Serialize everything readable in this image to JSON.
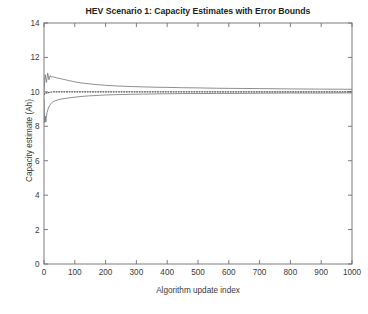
{
  "figure": {
    "title": "HEV Scenario 1: Capacity Estimates with Error Bounds",
    "x_axis_label": "Algorithm update index",
    "y_axis_label": "Capacity estimate (Ah)",
    "bottom_caption": "",
    "background_color": "#ffffff",
    "axis_color": "#6d6e71",
    "text_color": "#231f20"
  },
  "chart_data": {
    "type": "line",
    "title": "HEV Scenario 1: Capacity Estimates with Error Bounds",
    "xlabel": "Algorithm update index",
    "ylabel": "Capacity estimate (Ah)",
    "xlim": [
      0,
      1000
    ],
    "ylim": [
      0,
      14
    ],
    "xticks": [
      0,
      100,
      200,
      300,
      400,
      500,
      600,
      700,
      800,
      900,
      1000
    ],
    "yticks": [
      0,
      2,
      4,
      6,
      8,
      10,
      12,
      14
    ],
    "xtick_labels": [
      "0",
      "100",
      "200",
      "300",
      "400",
      "500",
      "600",
      "700",
      "800",
      "900",
      "1000"
    ],
    "ytick_labels": [
      "0",
      "2",
      "4",
      "6",
      "8",
      "10",
      "12",
      "14"
    ],
    "grid": false,
    "legend": null,
    "tick_direction": "in",
    "series": [
      {
        "name": "Upper error bound",
        "style": "solid",
        "color": "#7a7a7d",
        "x": [
          0,
          4,
          8,
          12,
          16,
          20,
          24,
          28,
          32,
          36,
          40,
          50,
          60,
          70,
          80,
          90,
          100,
          120,
          140,
          160,
          180,
          200,
          240,
          280,
          320,
          360,
          400,
          450,
          500,
          560,
          620,
          700,
          800,
          900,
          1000
        ],
        "values": [
          10.1,
          11.0,
          10.55,
          11.1,
          10.7,
          10.95,
          10.85,
          10.88,
          10.86,
          10.84,
          10.82,
          10.78,
          10.74,
          10.7,
          10.66,
          10.62,
          10.58,
          10.52,
          10.48,
          10.44,
          10.41,
          10.38,
          10.34,
          10.31,
          10.29,
          10.27,
          10.26,
          10.24,
          10.23,
          10.21,
          10.2,
          10.19,
          10.17,
          10.16,
          10.15
        ]
      },
      {
        "name": "Capacity estimate",
        "style": "dotted",
        "color": "#4a4a4c",
        "x": [
          0,
          4,
          8,
          12,
          16,
          20,
          24,
          28,
          32,
          40,
          50,
          60,
          70,
          80,
          90,
          100,
          120,
          140,
          160,
          180,
          200,
          240,
          280,
          320,
          360,
          400,
          450,
          500,
          560,
          620,
          700,
          800,
          900,
          1000
        ],
        "values": [
          9.85,
          9.9,
          9.95,
          9.92,
          9.97,
          9.98,
          9.99,
          10.0,
          10.0,
          10.0,
          10.0,
          10.0,
          10.0,
          10.0,
          10.0,
          10.0,
          10.0,
          10.0,
          10.0,
          10.0,
          10.0,
          10.0,
          10.0,
          10.0,
          10.0,
          10.0,
          10.0,
          10.0,
          10.0,
          10.0,
          10.0,
          10.0,
          10.0,
          10.0
        ]
      },
      {
        "name": "Lower error bound",
        "style": "solid",
        "color": "#7a7a7d",
        "x": [
          0,
          2,
          4,
          6,
          8,
          10,
          14,
          18,
          22,
          26,
          30,
          36,
          44,
          55,
          70,
          85,
          100,
          120,
          140,
          160,
          180,
          200,
          240,
          280,
          320,
          360,
          400,
          450,
          500,
          560,
          620,
          700,
          800,
          900,
          1000
        ],
        "values": [
          9.6,
          8.2,
          8.6,
          8.25,
          8.55,
          8.8,
          9.05,
          9.2,
          9.3,
          9.38,
          9.43,
          9.48,
          9.53,
          9.58,
          9.62,
          9.66,
          9.69,
          9.73,
          9.76,
          9.78,
          9.8,
          9.82,
          9.84,
          9.86,
          9.87,
          9.88,
          9.89,
          9.9,
          9.9,
          9.91,
          9.91,
          9.92,
          9.93,
          9.93,
          9.94
        ]
      }
    ]
  },
  "axes_geometry": {
    "left": 44,
    "right": 352,
    "top": 23,
    "bottom": 264
  }
}
